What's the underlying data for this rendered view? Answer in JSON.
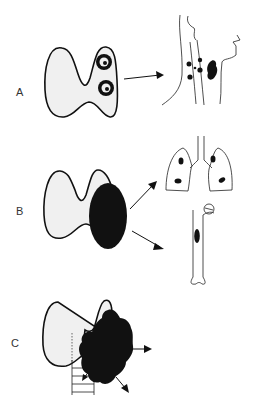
{
  "figure": {
    "panels": [
      {
        "id": "A",
        "label": "A",
        "description": "Thyroid with two encapsulated nodules; arrow to neck with lymph node metastases"
      },
      {
        "id": "B",
        "label": "B",
        "description": "Thyroid with large solid tumor in one lobe; arrows to lung and bone (femur) metastases"
      },
      {
        "id": "C",
        "label": "C",
        "description": "Thyroid with invasive irregular tumor extending beyond gland into trachea and surrounding tissue"
      }
    ],
    "colors": {
      "ink": "#111111",
      "gland_fill": "#f0f0f0",
      "background": "#ffffff"
    }
  }
}
